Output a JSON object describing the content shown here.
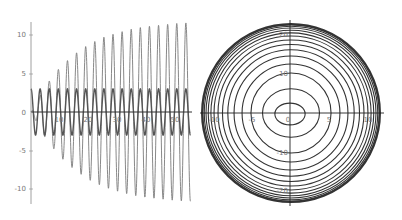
{
  "chart_data": [
    {
      "type": "line",
      "title": "",
      "xlabel": "",
      "ylabel": "",
      "xlim": [
        0,
        55
      ],
      "ylim": [
        -12,
        12
      ],
      "grid": false,
      "legend": null,
      "x_ticks": [
        10,
        20,
        30,
        40,
        50
      ],
      "x_tick_labels": [
        "10",
        "20",
        "30",
        "40",
        "50"
      ],
      "y_ticks": [
        10,
        5,
        0,
        -5,
        -10
      ],
      "y_tick_labels": [
        "10",
        "5",
        "0",
        "-5",
        "-10"
      ],
      "series": [
        {
          "name": "growing-amplitude oscillation",
          "description": "sinusoid, angular frequency ~2, amplitude envelope rising from ~0 and saturating near 12",
          "amplitude_envelope_samples": {
            "x": [
              0,
              5,
              10,
              15,
              20,
              25,
              30,
              35,
              40,
              45,
              50,
              55
            ],
            "y": [
              0,
              3.4,
              5.8,
              7.5,
              8.8,
              9.7,
              10.3,
              10.8,
              11.1,
              11.3,
              11.5,
              11.6
            ]
          },
          "omega": 2,
          "color": "#7a7a7a"
        },
        {
          "name": "constant-amplitude oscillation",
          "description": "sinusoid, angular frequency ~2, constant amplitude 3",
          "amplitude": 3,
          "omega": 2,
          "color": "#555555"
        }
      ]
    },
    {
      "type": "contour",
      "title": "",
      "xlabel": "",
      "ylabel": "",
      "xlim": [
        -11.5,
        11.5
      ],
      "ylim": [
        -23,
        23
      ],
      "grid": false,
      "legend": null,
      "x_ticks": [
        -10,
        -5,
        0,
        5,
        10
      ],
      "x_tick_labels": [
        "-10",
        "-5",
        "0",
        "5",
        "10"
      ],
      "y_ticks": [
        20,
        10,
        -10,
        -20
      ],
      "y_tick_labels": [
        "20",
        "10",
        "-10",
        "-20"
      ],
      "description": "nested elliptical contour lines, rendering as concentric circles, widely spaced near center and crowding toward the boundary",
      "contour_count": 15,
      "contour_radii_fraction": [
        0.17,
        0.32,
        0.45,
        0.55,
        0.64,
        0.71,
        0.77,
        0.82,
        0.865,
        0.9,
        0.93,
        0.955,
        0.975,
        0.99,
        1.0
      ],
      "color": "#333333"
    }
  ],
  "left_plot": {
    "x_tick_labels": [
      "10",
      "20",
      "30",
      "40",
      "50"
    ],
    "y_tick_labels": [
      "10",
      "5",
      "0",
      "-5",
      "-10"
    ]
  },
  "right_plot": {
    "x_tick_labels": [
      "-10",
      "-5",
      "0",
      "5",
      "10"
    ],
    "y_tick_labels": [
      "20",
      "10",
      "-10",
      "-20"
    ]
  }
}
